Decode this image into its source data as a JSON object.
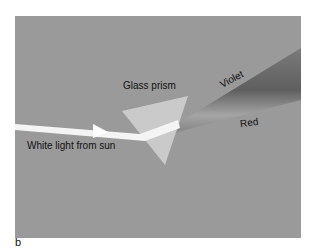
{
  "figure": {
    "caption_letter": "b",
    "labels": {
      "prism": "Glass prism",
      "incoming": "White light from sun",
      "violet": "Violet",
      "red": "Red"
    },
    "colors": {
      "background": "#9a9a9a",
      "prism": "#c8c8c8",
      "beam": "#f2f2f2",
      "spectrum_dark": "#707070",
      "spectrum_light": "#a8a8a8"
    }
  }
}
